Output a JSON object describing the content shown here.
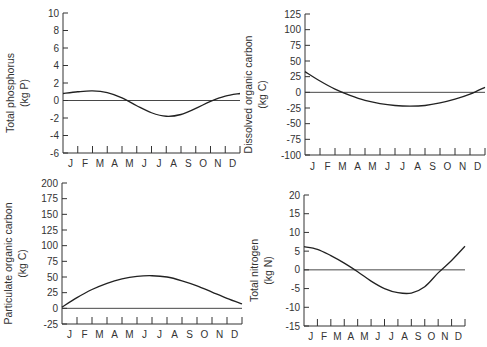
{
  "chart_data": [
    {
      "type": "line",
      "id": "phosphorus",
      "ylabel": "Total phosphorus",
      "yunit": "(kg P)",
      "categories": [
        "J",
        "F",
        "M",
        "A",
        "M",
        "J",
        "J",
        "A",
        "S",
        "O",
        "N",
        "D"
      ],
      "yticks": [
        10,
        8,
        6,
        4,
        2,
        0,
        -2,
        -4,
        -6
      ],
      "ylim": [
        -6,
        10
      ],
      "series": [
        {
          "name": "Total phosphorus",
          "x": [
            0,
            1,
            2,
            3,
            4,
            5,
            6,
            7,
            8,
            9,
            10,
            11,
            12
          ],
          "values": [
            0.8,
            1.0,
            1.1,
            0.9,
            0.3,
            -0.6,
            -1.4,
            -1.8,
            -1.6,
            -0.9,
            -0.1,
            0.5,
            0.8
          ]
        }
      ]
    },
    {
      "type": "line",
      "id": "doc",
      "ylabel": "Dissolved organic carbon",
      "yunit": "(kg C)",
      "categories": [
        "J",
        "F",
        "M",
        "A",
        "M",
        "J",
        "J",
        "A",
        "S",
        "O",
        "N",
        "D"
      ],
      "yticks": [
        125,
        100,
        75,
        50,
        25,
        0,
        -25,
        -50,
        -75,
        -100
      ],
      "ylim": [
        -100,
        125
      ],
      "series": [
        {
          "name": "Dissolved organic carbon",
          "x": [
            0,
            1,
            2,
            3,
            4,
            5,
            6,
            7,
            8,
            9,
            10,
            11,
            12
          ],
          "values": [
            33,
            18,
            5,
            -5,
            -13,
            -18,
            -21,
            -22,
            -21,
            -17,
            -11,
            -3,
            8
          ]
        }
      ]
    },
    {
      "type": "line",
      "id": "poc",
      "ylabel": "Particulate organic carbon",
      "yunit": "(kg C)",
      "categories": [
        "J",
        "F",
        "M",
        "A",
        "M",
        "J",
        "J",
        "A",
        "S",
        "O",
        "N",
        "D"
      ],
      "yticks": [
        200,
        175,
        150,
        125,
        100,
        75,
        50,
        25,
        0,
        -25
      ],
      "ylim": [
        -25,
        200
      ],
      "series": [
        {
          "name": "Particulate organic carbon",
          "x": [
            0,
            1,
            2,
            3,
            4,
            5,
            6,
            7,
            8,
            9,
            10,
            11,
            12
          ],
          "values": [
            2,
            17,
            30,
            40,
            47,
            51,
            52,
            50,
            44,
            36,
            26,
            16,
            7
          ]
        }
      ]
    },
    {
      "type": "line",
      "id": "nitrogen",
      "ylabel": "Total nitrogen",
      "yunit": "(kg N)",
      "categories": [
        "J",
        "F",
        "M",
        "A",
        "M",
        "J",
        "J",
        "A",
        "S",
        "O",
        "N",
        "D"
      ],
      "yticks": [
        20,
        15,
        10,
        5,
        0,
        -5,
        -10,
        -15
      ],
      "ylim": [
        -15,
        20
      ],
      "series": [
        {
          "name": "Total nitrogen",
          "x": [
            0,
            1,
            2,
            3,
            4,
            5,
            6,
            7,
            8,
            9,
            10,
            11,
            12
          ],
          "values": [
            6.2,
            5.5,
            3.8,
            1.8,
            -0.5,
            -3.0,
            -5.0,
            -6.1,
            -6.2,
            -4.5,
            -0.8,
            2.5,
            6.3
          ]
        }
      ]
    }
  ]
}
